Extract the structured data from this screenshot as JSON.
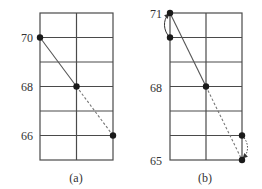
{
  "panels": [
    {
      "id": "a",
      "caption": "(a)",
      "y_labels": [
        {
          "text": "70",
          "value": 70
        },
        {
          "text": "68",
          "value": 68
        },
        {
          "text": "66",
          "value": 66
        }
      ],
      "grid": {
        "rows": 6,
        "cols": 2
      },
      "points": [
        {
          "col": 0,
          "row": 1,
          "label": "70"
        },
        {
          "col": 1,
          "row": 3,
          "label": "68"
        },
        {
          "col": 2,
          "row": 5,
          "label": "66"
        }
      ],
      "segments": [
        {
          "from": 0,
          "to": 1,
          "style": "solid"
        },
        {
          "from": 1,
          "to": 2,
          "style": "dashed"
        }
      ]
    },
    {
      "id": "b",
      "caption": "(b)",
      "y_labels": [
        {
          "text": "71",
          "value": 71
        },
        {
          "text": "68",
          "value": 68
        },
        {
          "text": "65",
          "value": 65
        }
      ],
      "grid": {
        "rows": 6,
        "cols": 2
      },
      "points": [
        {
          "col": 0,
          "row": 0,
          "label": "71"
        },
        {
          "col": 0,
          "row": 1
        },
        {
          "col": 1,
          "row": 3,
          "label": "68"
        },
        {
          "col": 2,
          "row": 5
        },
        {
          "col": 2,
          "row": 6,
          "label": "65"
        }
      ],
      "segments": [
        {
          "from": 0,
          "to": 2,
          "style": "solid"
        },
        {
          "from": 2,
          "to": 4,
          "style": "dashed"
        }
      ],
      "arcs": [
        {
          "from": 1,
          "to": 0,
          "side": "left",
          "style": "solid-arrow"
        },
        {
          "from": 3,
          "to": 4,
          "side": "right",
          "style": "dotted-arrow"
        }
      ]
    }
  ],
  "colors": {
    "grid": "#4a4a4a",
    "line": "#555555",
    "point": "#1a1a1a",
    "text": "#333333"
  }
}
